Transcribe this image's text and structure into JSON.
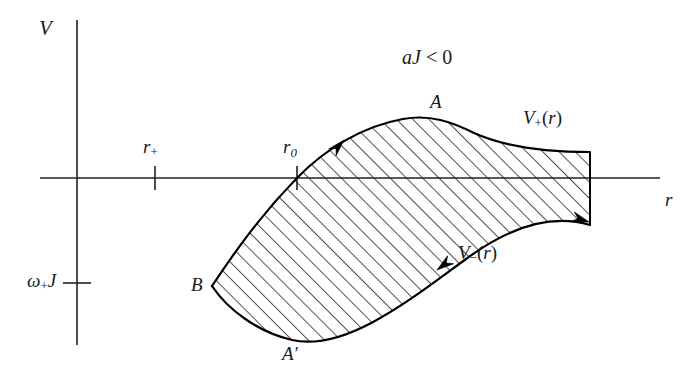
{
  "figure": {
    "domain": "diagram",
    "kind": "physics-potential-diagram",
    "background_color": "#ffffff",
    "ink_color": "#000000",
    "axes": {
      "vertical": {
        "name": "V-axis",
        "label": "V",
        "x": 77,
        "y_top": 20,
        "y_bottom": 345
      },
      "horizontal": {
        "name": "r-axis",
        "label": "r",
        "y": 178,
        "x_left": 40,
        "x_right": 660
      },
      "origin": {
        "x": 77,
        "y": 178
      }
    },
    "ticks": [
      {
        "id": "r-plus",
        "label": "r",
        "sub": "+",
        "axis": "horizontal",
        "x": 155,
        "y": 178,
        "half_len": 12
      },
      {
        "id": "r-zero",
        "label": "r",
        "sub": "0",
        "axis": "horizontal",
        "x": 297,
        "y": 178,
        "half_len": 12
      },
      {
        "id": "omega-J",
        "label": "ω",
        "sub": "+",
        "tail": "J",
        "axis": "vertical",
        "x": 77,
        "y": 283,
        "half_len": 14
      }
    ],
    "annotations": {
      "condition": {
        "italic": "aJ",
        "relation": "< 0",
        "full": "aJ < 0",
        "x": 402,
        "y": 47
      },
      "curve_upper": {
        "label": "V",
        "sub": "+",
        "suffix": "(r)",
        "full": "V+(r)",
        "x": 523,
        "y": 108
      },
      "curve_lower": {
        "label": "V",
        "sub": "−",
        "suffix": "(r)",
        "full": "V−(r)",
        "x": 458,
        "y": 243
      }
    },
    "points": [
      {
        "id": "A",
        "label": "A",
        "x": 440,
        "y": 118,
        "label_x": 430,
        "label_y": 92
      },
      {
        "id": "A-prime",
        "label": "A′",
        "x": 292,
        "y": 340,
        "label_x": 282,
        "label_y": 344
      },
      {
        "id": "B",
        "label": "B",
        "x": 212,
        "y": 286,
        "label_x": 191,
        "label_y": 275
      }
    ],
    "region": {
      "name": "ergoregion-shaded-band",
      "fill": "diagonal-hatch",
      "hatch_angle_deg": 45,
      "hatch_spacing_px": 11.5,
      "hatch_stroke": "#111111",
      "upper_boundary_path": "M 212 286 C 238 247 262 214 297 178 C 326 148 364 126 403 119 C 430 114 452 122 474 133 C 503 146 540 152 590 152",
      "lower_boundary_path": "M 212 286 C 228 310 258 332 292 340 C 345 352 410 300 466 259 C 516 222 556 215 590 225",
      "right_edge": {
        "x": 590,
        "y_top": 152,
        "y_bottom": 225
      },
      "left_vertex": {
        "x": 212,
        "y": 286
      }
    },
    "flow_arrows": [
      {
        "id": "arrow-upper",
        "x": 344,
        "y": 140,
        "angle_deg": -47,
        "direction": "up-right",
        "on": "upper-boundary"
      },
      {
        "id": "arrow-lower",
        "x": 437,
        "y": 270,
        "angle_deg": 143,
        "direction": "down-left",
        "on": "lower-boundary"
      },
      {
        "id": "arrow-right",
        "x": 589,
        "y": 222,
        "angle_deg": 18,
        "direction": "right-down",
        "on": "lower-boundary-end"
      }
    ]
  }
}
